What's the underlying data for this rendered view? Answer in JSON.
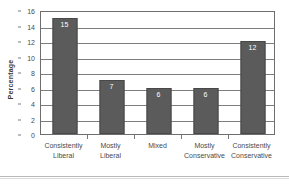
{
  "chart_data": {
    "type": "bar",
    "title": "",
    "subtitle": "",
    "xlabel": "",
    "ylabel": "Percentage",
    "categories": [
      "Consistently\nLiberal",
      "Mostly\nLiberal",
      "Mixed",
      "Mostly\nConservative",
      "Consistently\nConservative"
    ],
    "values": [
      15,
      7,
      6,
      6,
      12
    ],
    "data_labels": [
      "15",
      "7",
      "6",
      "6",
      "12"
    ],
    "ylim": [
      0,
      16
    ],
    "yticks": [
      0,
      2,
      4,
      6,
      8,
      10,
      12,
      14,
      16
    ],
    "ytick_labels": [
      "0",
      "2",
      "4",
      "6",
      "8",
      "10",
      "12",
      "14",
      "16"
    ],
    "grid": true,
    "grid_axis": "y",
    "legend": false,
    "legend_position": "none",
    "bar_color": "#5b5b5b",
    "bar_edge_color": "#484848",
    "data_label_color": "#ffffff",
    "grid_color": "#7d7d7d",
    "axis_color": "#6e6e6e",
    "background_color": "#ffffff",
    "text_color": "#4a4a4a"
  },
  "figure": {
    "y_axis_title": "Percentage"
  }
}
